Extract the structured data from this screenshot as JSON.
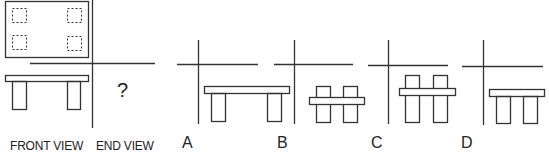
{
  "labels": {
    "front_view": "FRONT VIEW",
    "end_view": "END VIEW",
    "question_mark": "?",
    "options": [
      "A",
      "B",
      "C",
      "D"
    ]
  },
  "colors": {
    "stroke": "#333333",
    "background": "#ffffff"
  },
  "figure": {
    "top_view": {
      "shape": "rectangle",
      "hidden_leg_squares": 4,
      "line_style": "dashed"
    },
    "front_view": {
      "description": "slab on two legs"
    },
    "option_a": {
      "description": "long slab on two outer legs"
    },
    "option_b": {
      "description": "short slab crossing two posts at middle"
    },
    "option_c": {
      "description": "short slab crossing two posts near top"
    },
    "option_d": {
      "description": "short slab on two close legs"
    }
  }
}
